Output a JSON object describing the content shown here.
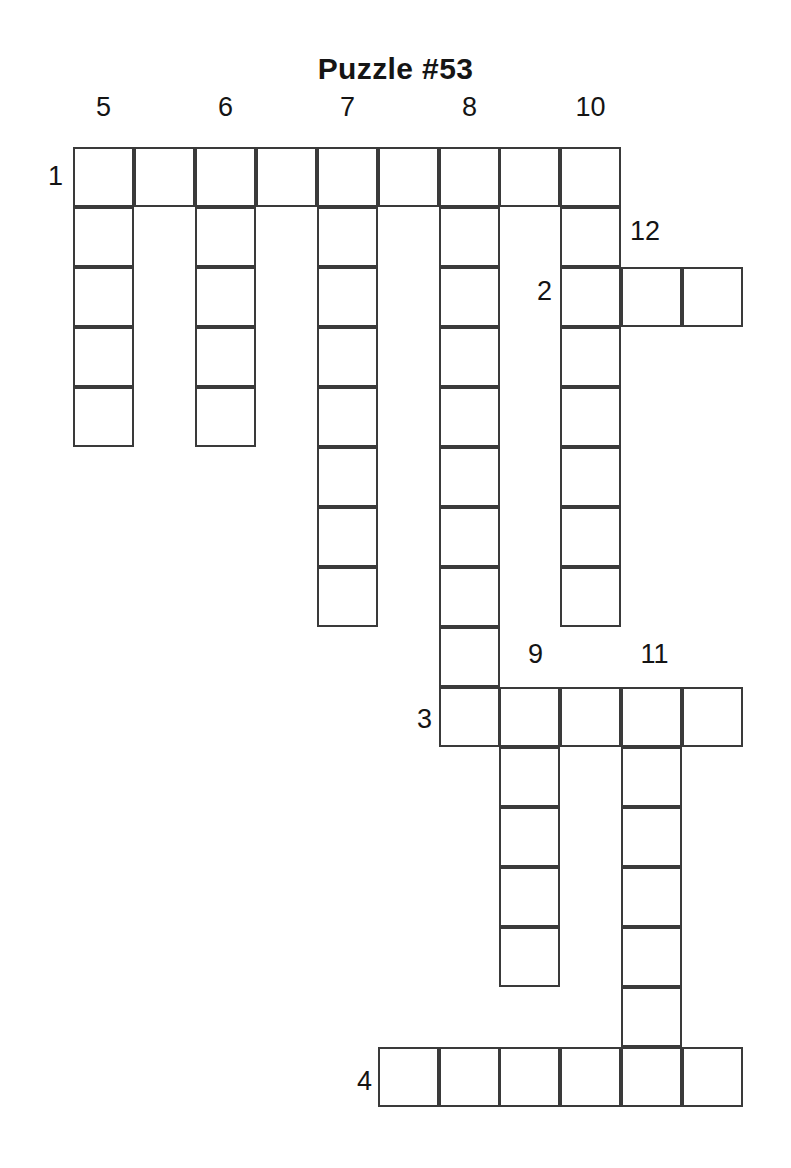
{
  "title": "Puzzle #53",
  "puzzle": {
    "kind": "crossword-skeleton",
    "cell_size": {
      "width": 61,
      "height": 60
    },
    "origin": {
      "x": 73,
      "y": 147
    },
    "across_entries": [
      {
        "number": "1",
        "row": 0,
        "col": 0,
        "length": 9
      },
      {
        "number": "2",
        "row": 2,
        "col": 8,
        "length": 3
      },
      {
        "number": "3",
        "row": 9,
        "col": 6,
        "length": 5
      },
      {
        "number": "4",
        "row": 15,
        "col": 5,
        "length": 6
      }
    ],
    "down_entries": [
      {
        "number": "5",
        "row": 0,
        "col": 0,
        "length": 5
      },
      {
        "number": "6",
        "row": 0,
        "col": 2,
        "length": 5
      },
      {
        "number": "7",
        "row": 0,
        "col": 4,
        "length": 8
      },
      {
        "number": "8",
        "row": 0,
        "col": 6,
        "length": 10
      },
      {
        "number": "10",
        "row": 0,
        "col": 9,
        "length": 8
      },
      {
        "number": "12",
        "row": 2,
        "col": 9,
        "length": 1
      },
      {
        "number": "9",
        "row": 9,
        "col": 7,
        "length": 5
      },
      {
        "number": "11",
        "row": 9,
        "col": 9,
        "length": 7
      }
    ],
    "labels": {
      "column_numbers": [
        "5",
        "6",
        "7",
        "8",
        "10"
      ],
      "row_numbers": [
        "1",
        "2",
        "3",
        "4"
      ],
      "inline_numbers": [
        "12",
        "9",
        "11"
      ]
    }
  },
  "clue_numbers": [
    {
      "text": "5",
      "x": 73,
      "y": 94,
      "w": 61,
      "align": "center"
    },
    {
      "text": "6",
      "x": 195,
      "y": 94,
      "w": 61,
      "align": "center"
    },
    {
      "text": "7",
      "x": 317,
      "y": 94,
      "w": 61,
      "align": "center"
    },
    {
      "text": "8",
      "x": 439,
      "y": 94,
      "w": 61,
      "align": "center"
    },
    {
      "text": "10",
      "x": 560,
      "y": 94,
      "w": 61,
      "align": "center"
    },
    {
      "text": "1",
      "x": 16,
      "y": 163,
      "w": 47,
      "align": "right"
    },
    {
      "text": "12",
      "x": 630,
      "y": 218,
      "w": 47,
      "align": "left"
    },
    {
      "text": "2",
      "x": 505,
      "y": 278,
      "w": 47,
      "align": "right"
    },
    {
      "text": "9",
      "x": 505,
      "y": 641,
      "w": 61,
      "align": "center"
    },
    {
      "text": "11",
      "x": 624,
      "y": 641,
      "w": 61,
      "align": "center"
    },
    {
      "text": "3",
      "x": 385,
      "y": 706,
      "w": 47,
      "align": "right"
    },
    {
      "text": "4",
      "x": 325,
      "y": 1068,
      "w": 47,
      "align": "right"
    }
  ],
  "cells": [
    {
      "x": 73,
      "y": 147,
      "w": 61,
      "h": 60
    },
    {
      "x": 134,
      "y": 147,
      "w": 61,
      "h": 60
    },
    {
      "x": 195,
      "y": 147,
      "w": 61,
      "h": 60
    },
    {
      "x": 256,
      "y": 147,
      "w": 61,
      "h": 60
    },
    {
      "x": 317,
      "y": 147,
      "w": 61,
      "h": 60
    },
    {
      "x": 378,
      "y": 147,
      "w": 61,
      "h": 60
    },
    {
      "x": 439,
      "y": 147,
      "w": 61,
      "h": 60
    },
    {
      "x": 499,
      "y": 147,
      "w": 61,
      "h": 60
    },
    {
      "x": 560,
      "y": 147,
      "w": 61,
      "h": 60
    },
    {
      "x": 73,
      "y": 207,
      "w": 61,
      "h": 60
    },
    {
      "x": 195,
      "y": 207,
      "w": 61,
      "h": 60
    },
    {
      "x": 317,
      "y": 207,
      "w": 61,
      "h": 60
    },
    {
      "x": 439,
      "y": 207,
      "w": 61,
      "h": 60
    },
    {
      "x": 560,
      "y": 207,
      "w": 61,
      "h": 60
    },
    {
      "x": 73,
      "y": 267,
      "w": 61,
      "h": 60
    },
    {
      "x": 195,
      "y": 267,
      "w": 61,
      "h": 60
    },
    {
      "x": 317,
      "y": 267,
      "w": 61,
      "h": 60
    },
    {
      "x": 439,
      "y": 267,
      "w": 61,
      "h": 60
    },
    {
      "x": 560,
      "y": 267,
      "w": 61,
      "h": 60
    },
    {
      "x": 621,
      "y": 267,
      "w": 61,
      "h": 60
    },
    {
      "x": 682,
      "y": 267,
      "w": 61,
      "h": 60
    },
    {
      "x": 73,
      "y": 327,
      "w": 61,
      "h": 60
    },
    {
      "x": 195,
      "y": 327,
      "w": 61,
      "h": 60
    },
    {
      "x": 317,
      "y": 327,
      "w": 61,
      "h": 60
    },
    {
      "x": 439,
      "y": 327,
      "w": 61,
      "h": 60
    },
    {
      "x": 560,
      "y": 327,
      "w": 61,
      "h": 60
    },
    {
      "x": 73,
      "y": 387,
      "w": 61,
      "h": 60
    },
    {
      "x": 195,
      "y": 387,
      "w": 61,
      "h": 60
    },
    {
      "x": 317,
      "y": 387,
      "w": 61,
      "h": 60
    },
    {
      "x": 439,
      "y": 387,
      "w": 61,
      "h": 60
    },
    {
      "x": 560,
      "y": 387,
      "w": 61,
      "h": 60
    },
    {
      "x": 317,
      "y": 447,
      "w": 61,
      "h": 60
    },
    {
      "x": 439,
      "y": 447,
      "w": 61,
      "h": 60
    },
    {
      "x": 560,
      "y": 447,
      "w": 61,
      "h": 60
    },
    {
      "x": 317,
      "y": 507,
      "w": 61,
      "h": 60
    },
    {
      "x": 439,
      "y": 507,
      "w": 61,
      "h": 60
    },
    {
      "x": 560,
      "y": 507,
      "w": 61,
      "h": 60
    },
    {
      "x": 317,
      "y": 567,
      "w": 61,
      "h": 60
    },
    {
      "x": 439,
      "y": 567,
      "w": 61,
      "h": 60
    },
    {
      "x": 560,
      "y": 567,
      "w": 61,
      "h": 60
    },
    {
      "x": 439,
      "y": 627,
      "w": 61,
      "h": 60
    },
    {
      "x": 439,
      "y": 687,
      "w": 61,
      "h": 60
    },
    {
      "x": 499,
      "y": 687,
      "w": 61,
      "h": 60
    },
    {
      "x": 560,
      "y": 687,
      "w": 61,
      "h": 60
    },
    {
      "x": 621,
      "y": 687,
      "w": 61,
      "h": 60
    },
    {
      "x": 682,
      "y": 687,
      "w": 61,
      "h": 60
    },
    {
      "x": 499,
      "y": 747,
      "w": 61,
      "h": 60
    },
    {
      "x": 621,
      "y": 747,
      "w": 61,
      "h": 60
    },
    {
      "x": 499,
      "y": 807,
      "w": 61,
      "h": 60
    },
    {
      "x": 621,
      "y": 807,
      "w": 61,
      "h": 60
    },
    {
      "x": 499,
      "y": 867,
      "w": 61,
      "h": 60
    },
    {
      "x": 621,
      "y": 867,
      "w": 61,
      "h": 60
    },
    {
      "x": 499,
      "y": 927,
      "w": 61,
      "h": 60
    },
    {
      "x": 621,
      "y": 927,
      "w": 61,
      "h": 60
    },
    {
      "x": 621,
      "y": 987,
      "w": 61,
      "h": 60
    },
    {
      "x": 378,
      "y": 1047,
      "w": 61,
      "h": 60
    },
    {
      "x": 439,
      "y": 1047,
      "w": 61,
      "h": 60
    },
    {
      "x": 499,
      "y": 1047,
      "w": 61,
      "h": 60
    },
    {
      "x": 560,
      "y": 1047,
      "w": 61,
      "h": 60
    },
    {
      "x": 621,
      "y": 1047,
      "w": 61,
      "h": 60
    },
    {
      "x": 682,
      "y": 1047,
      "w": 61,
      "h": 60
    }
  ]
}
